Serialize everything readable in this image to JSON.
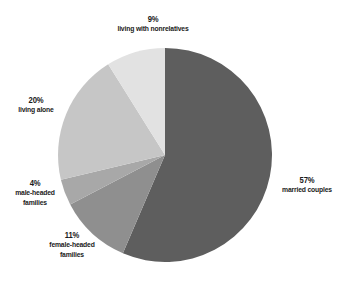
{
  "chart_data": {
    "type": "pie",
    "title": "",
    "start_angle_deg": 0,
    "direction": "clockwise",
    "slices": [
      {
        "label": "married couples",
        "value": 57,
        "pct_label": "57%",
        "color": "#5e5e5e"
      },
      {
        "label": "female-headed families",
        "value": 11,
        "pct_label": "11%",
        "color": "#8f8f8f"
      },
      {
        "label": "male-headed families",
        "value": 4,
        "pct_label": "4%",
        "color": "#a8a8a8"
      },
      {
        "label": "living alone",
        "value": 20,
        "pct_label": "20%",
        "color": "#c6c6c6"
      },
      {
        "label": "living with nonrelatives",
        "value": 9,
        "pct_label": "9%",
        "color": "#e2e2e2"
      }
    ],
    "legend": "none (inline labels)"
  },
  "labels": {
    "married": {
      "pct": "57%",
      "line1": "married couples",
      "line2": ""
    },
    "female": {
      "pct": "11%",
      "line1": "female-headed",
      "line2": "families"
    },
    "male": {
      "pct": "4%",
      "line1": "male-headed",
      "line2": "families"
    },
    "alone": {
      "pct": "20%",
      "line1": "living alone",
      "line2": ""
    },
    "nonrel": {
      "pct": "9%",
      "line1": "living with nonrelatives",
      "line2": ""
    }
  }
}
